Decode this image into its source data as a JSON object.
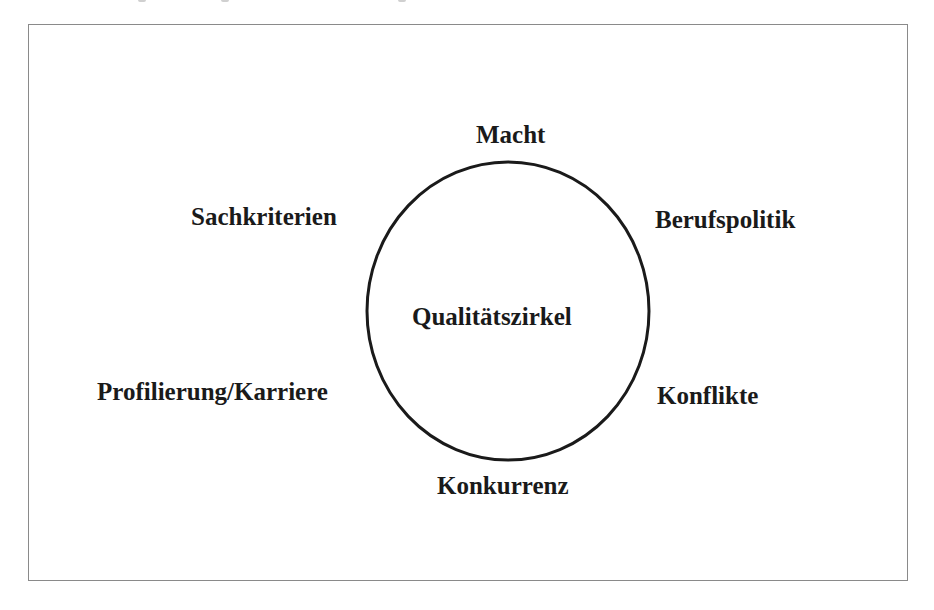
{
  "diagram": {
    "center_label": "Qualitätszirkel",
    "labels": {
      "top": "Macht",
      "upper_left": "Sachkriterien",
      "upper_right": "Berufspolitik",
      "lower_left": "Profilierung/Karriere",
      "lower_right": "Konflikte",
      "bottom": "Konkurrenz"
    },
    "colors": {
      "stroke": "#1a1a1a",
      "frame": "#8a8a8a",
      "background": "#ffffff"
    }
  }
}
